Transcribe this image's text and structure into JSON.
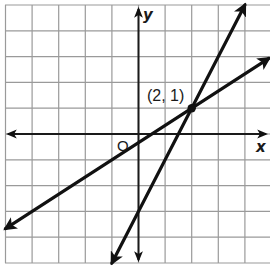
{
  "chart_data": {
    "type": "line",
    "title": "",
    "xlabel": "x",
    "ylabel": "y",
    "origin_label": "O",
    "xlim": [
      -5,
      4.9
    ],
    "ylim": [
      -4.9,
      5
    ],
    "grid": true,
    "legend": null,
    "series": [
      {
        "name": "y = 2x - 3",
        "slope": 2,
        "intercept": -3,
        "x": [
          -1,
          4
        ],
        "y": [
          -5,
          5
        ],
        "arrows": "both"
      },
      {
        "name": "y = (2/3)x - 1/3",
        "slope": 0.6667,
        "intercept": -0.3333,
        "x": [
          -5,
          4.9
        ],
        "y": [
          -3.67,
          2.93
        ],
        "arrows": "both"
      }
    ],
    "points": [
      {
        "x": 2,
        "y": 1,
        "label": "(2, 1)"
      }
    ]
  },
  "labels": {
    "x_axis": "x",
    "y_axis": "y",
    "origin": "O",
    "intersection": "(2, 1)"
  },
  "colors": {
    "line": "#111111",
    "grid": "#9a9a9a",
    "background": "#ffffff"
  }
}
